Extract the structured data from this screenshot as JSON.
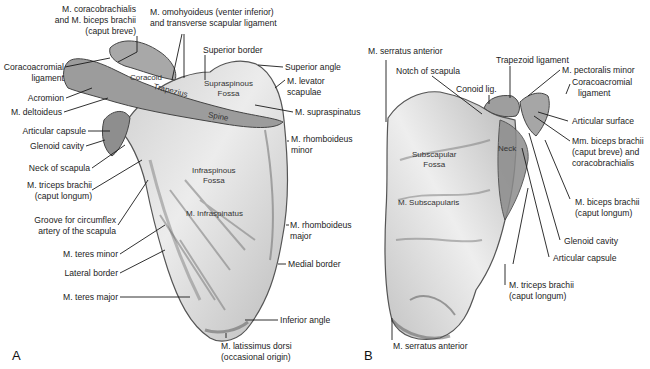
{
  "figure": {
    "panels": [
      {
        "id": "A",
        "letter": "A",
        "view": "posterior"
      },
      {
        "id": "B",
        "letter": "B",
        "view": "anterior"
      }
    ]
  },
  "panelA": {
    "labels": {
      "coracobrachialis_l1": "M. coracobrachialis",
      "coracobrachialis_l2": "and M. biceps brachii",
      "coracobrachialis_l3": "(caput breve)",
      "omohyoideus_l1": "M. omohyoideus (venter inferior)",
      "omohyoideus_l2": "and transverse scapular ligament",
      "coracoacromial_l1": "Coracoacromial",
      "coracoacromial_l2": "ligament",
      "acromion": "Acromion",
      "deltoideus": "M. deltoideus",
      "articular_capsule": "Articular capsule",
      "glenoid_cavity": "Glenoid cavity",
      "neck_of_scapula": "Neck of scapula",
      "triceps_l1": "M. triceps brachii",
      "triceps_l2": "(caput longum)",
      "groove_l1": "Groove for circumflex",
      "groove_l2": "artery of the scapula",
      "teres_minor": "M. teres minor",
      "lateral_border": "Lateral border",
      "teres_major": "M. teres major",
      "superior_border": "Superior border",
      "superior_angle": "Superior angle",
      "levator_l1": "M. levator",
      "levator_l2": "scapulae",
      "supraspinatus": "M. supraspinatus",
      "rhomboideus_minor_l1": "M. rhomboideus",
      "rhomboideus_minor_l2": "minor",
      "rhomboideus_major_l1": "M. rhomboideus",
      "rhomboideus_major_l2": "major",
      "medial_border": "Medial border",
      "inferior_angle": "Inferior angle",
      "latissimus_l1": "M. latissimus dorsi",
      "latissimus_l2": "(occasional origin)"
    },
    "inbone": {
      "coracoid": "Coracoid",
      "trapezius": "Trapezius",
      "spine": "Spine",
      "supraspinous_l1": "Supraspinous",
      "supraspinous_l2": "Fossa",
      "infraspinous_l1": "Infraspinous",
      "infraspinous_l2": "Fossa",
      "infraspinatus": "M. Infraspinatus"
    }
  },
  "panelB": {
    "labels": {
      "serratus_top": "M. serratus anterior",
      "notch": "Notch of scapula",
      "conoid": "Conoid lig.",
      "trapezoid": "Trapezoid ligament",
      "pectoralis_minor": "M. pectoralis minor",
      "coracoacromial_l1": "Coracoacromial",
      "coracoacromial_l2": "ligament",
      "articular_surface": "Articular surface",
      "biceps_breve_l1": "Mm. biceps brachii",
      "biceps_breve_l2": "(caput breve) and",
      "biceps_breve_l3": "coracobrachialis",
      "biceps_longum_l1": "M. biceps brachii",
      "biceps_longum_l2": "(caput longum)",
      "glenoid_cavity": "Glenoid cavity",
      "articular_capsule": "Articular capsule",
      "triceps_l1": "M. triceps brachii",
      "triceps_l2": "(caput longum)",
      "serratus_bottom": "M. serratus anterior"
    },
    "inbone": {
      "subscapular_l1": "Subscapular",
      "subscapular_l2": "Fossa",
      "subscapularis": "M. Subscapularis",
      "neck": "Neck"
    }
  }
}
